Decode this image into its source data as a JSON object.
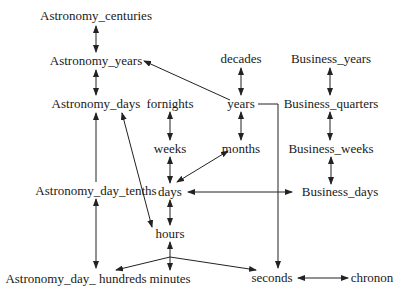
{
  "diagram": {
    "type": "time-granularity-graph",
    "nodes": [
      {
        "id": "astronomy_centuries",
        "label": "Astronomy_centuries",
        "x": 96,
        "y": 20
      },
      {
        "id": "astronomy_years",
        "label": "Astronomy_years",
        "x": 96,
        "y": 65
      },
      {
        "id": "astronomy_days",
        "label": "Astronomy_days",
        "x": 96,
        "y": 108
      },
      {
        "id": "fornights",
        "label": "fornights",
        "x": 170,
        "y": 108
      },
      {
        "id": "decades",
        "label": "decades",
        "x": 241,
        "y": 63
      },
      {
        "id": "years",
        "label": "years",
        "x": 241,
        "y": 108
      },
      {
        "id": "months",
        "label": "months",
        "x": 241,
        "y": 153
      },
      {
        "id": "business_years",
        "label": "Business_years",
        "x": 330,
        "y": 63
      },
      {
        "id": "business_quarters",
        "label": "Business_quarters",
        "x": 330,
        "y": 108
      },
      {
        "id": "business_weeks",
        "label": "Business_weeks",
        "x": 330,
        "y": 153
      },
      {
        "id": "weeks",
        "label": "weeks",
        "x": 170,
        "y": 153
      },
      {
        "id": "days",
        "label": "days",
        "x": 170,
        "y": 196
      },
      {
        "id": "business_days",
        "label": "Business_days",
        "x": 340,
        "y": 196
      },
      {
        "id": "astronomy_day_tenths",
        "label": "Astronomy_day_tenths",
        "x": 96,
        "y": 195
      },
      {
        "id": "hours",
        "label": "hours",
        "x": 170,
        "y": 238
      },
      {
        "id": "astronomy_day_hundreds",
        "label": "Astronomy_day_ hundreds",
        "x": 76,
        "y": 283
      },
      {
        "id": "minutes",
        "label": "minutes",
        "x": 170,
        "y": 283
      },
      {
        "id": "seconds",
        "label": "seconds",
        "x": 272,
        "y": 282
      },
      {
        "id": "chronon",
        "label": "chronon",
        "x": 352,
        "y": 282
      }
    ],
    "edges": [
      {
        "from": "astronomy_centuries",
        "to": "astronomy_years",
        "dir": "both"
      },
      {
        "from": "astronomy_years",
        "to": "astronomy_days",
        "dir": "both"
      },
      {
        "from": "years",
        "to": "astronomy_years",
        "dir": "forward"
      },
      {
        "from": "decades",
        "to": "years",
        "dir": "both"
      },
      {
        "from": "years",
        "to": "months",
        "dir": "both"
      },
      {
        "from": "business_years",
        "to": "business_quarters",
        "dir": "both"
      },
      {
        "from": "business_quarters",
        "to": "business_weeks",
        "dir": "both"
      },
      {
        "from": "business_weeks",
        "to": "business_days",
        "dir": "both"
      },
      {
        "from": "fornights",
        "to": "weeks",
        "dir": "both"
      },
      {
        "from": "weeks",
        "to": "days",
        "dir": "both"
      },
      {
        "from": "months",
        "to": "days",
        "dir": "both"
      },
      {
        "from": "days",
        "to": "business_days",
        "dir": "both"
      },
      {
        "from": "days",
        "to": "hours",
        "dir": "both"
      },
      {
        "from": "astronomy_days",
        "to": "astronomy_day_tenths",
        "dir": "backward"
      },
      {
        "from": "astronomy_days",
        "to": "hours",
        "dir": "both"
      },
      {
        "from": "astronomy_day_tenths",
        "to": "astronomy_day_hundreds",
        "dir": "both"
      },
      {
        "from": "hours",
        "to": "minutes",
        "dir": "both"
      },
      {
        "from": "minutes",
        "to": "astronomy_day_hundreds",
        "dir": "forward"
      },
      {
        "from": "minutes",
        "to": "seconds",
        "dir": "forward"
      },
      {
        "from": "years",
        "to": "seconds",
        "dir": "forward",
        "routing": "elbow"
      },
      {
        "from": "seconds",
        "to": "chronon",
        "dir": "both"
      }
    ]
  },
  "labels": {
    "astronomy_centuries": "Astronomy_centuries",
    "astronomy_years": "Astronomy_years",
    "astronomy_days": "Astronomy_days",
    "fornights": "fornights",
    "decades": "decades",
    "years": "years",
    "months": "months",
    "business_years": "Business_years",
    "business_quarters": "Business_quarters",
    "business_weeks": "Business_weeks",
    "weeks": "weeks",
    "days": "days",
    "business_days": "Business_days",
    "astronomy_day_tenths": "Astronomy_day_tenths",
    "hours": "hours",
    "astronomy_day_hundreds": "Astronomy_day_ hundreds",
    "minutes": "minutes",
    "seconds": "seconds",
    "chronon": "chronon"
  }
}
